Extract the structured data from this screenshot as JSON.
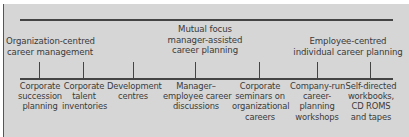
{
  "diagram": {
    "type": "continuum",
    "colors": {
      "background": "#d6d6d6",
      "line": "#444444",
      "text": "#3a3a3a"
    },
    "headings": [
      {
        "lines": [
          "Organization-centred",
          "career management"
        ],
        "position": "left"
      },
      {
        "lines": [
          "Mutual focus",
          "manager-assisted",
          "career planning"
        ],
        "position": "center"
      },
      {
        "lines": [
          "Employee-centred",
          "individual career planning"
        ],
        "position": "right"
      }
    ],
    "items": [
      {
        "lines": [
          "Corporate",
          "succession",
          "planning"
        ]
      },
      {
        "lines": [
          "Corporate",
          "talent",
          "inventories"
        ]
      },
      {
        "lines": [
          "Development",
          "centres"
        ]
      },
      {
        "lines": [
          "Manager–",
          "employee career",
          "discussions"
        ]
      },
      {
        "lines": [
          "Corporate",
          "seminars on",
          "organizational",
          "careers"
        ]
      },
      {
        "lines": [
          "Company-run",
          "career-",
          "planning",
          "workshops"
        ]
      },
      {
        "lines": [
          "Self-directed",
          "workbooks,",
          "CD ROMS",
          "and tapes"
        ]
      }
    ]
  }
}
